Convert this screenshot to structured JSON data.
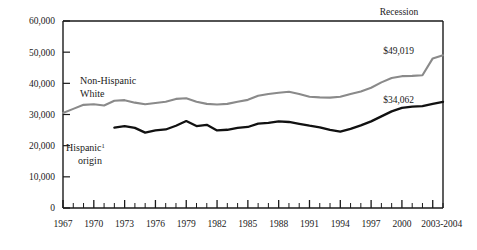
{
  "chart_data": {
    "type": "line",
    "title": "",
    "xlabel": "",
    "ylabel": "",
    "ylim": [
      0,
      60000
    ],
    "xlim": [
      1967,
      2004
    ],
    "grid": false,
    "legend_position": "inline-annotations",
    "ytick_labels": [
      "60,000",
      "50,000",
      "40,000",
      "30,000",
      "20,000",
      "10,000",
      "0"
    ],
    "ytick_values": [
      60000,
      50000,
      40000,
      30000,
      20000,
      10000,
      0
    ],
    "xtick_labels": [
      "1967",
      "1970",
      "1973",
      "1976",
      "1979",
      "1982",
      "1985",
      "1988",
      "1991",
      "1994",
      "1997",
      "2000",
      "2003-2004"
    ],
    "xtick_values": [
      1967,
      1970,
      1973,
      1976,
      1979,
      1982,
      1985,
      1988,
      1991,
      1994,
      1997,
      2000,
      2003
    ],
    "x": [
      1967,
      1968,
      1969,
      1970,
      1971,
      1972,
      1973,
      1974,
      1975,
      1976,
      1977,
      1978,
      1979,
      1980,
      1981,
      1982,
      1983,
      1984,
      1985,
      1986,
      1987,
      1988,
      1989,
      1990,
      1991,
      1992,
      1993,
      1994,
      1995,
      1996,
      1997,
      1998,
      1999,
      2000,
      2001,
      2002,
      2003,
      2004
    ],
    "series": [
      {
        "name": "Non-Hispanic White",
        "color": "#8a8a8a",
        "label_text": "Non-Hispanic",
        "label_text2": "White",
        "end_label": "$49,019",
        "end_value": 49019,
        "values": [
          30500,
          31800,
          33100,
          33300,
          32900,
          34400,
          34600,
          33800,
          33300,
          33700,
          34100,
          35000,
          35200,
          34100,
          33400,
          33200,
          33400,
          34100,
          34700,
          36000,
          36600,
          37000,
          37300,
          36600,
          35700,
          35500,
          35400,
          35700,
          36600,
          37400,
          38600,
          40300,
          41700,
          42300,
          42400,
          42600,
          48000,
          49019
        ]
      },
      {
        "name": "Hispanic origin",
        "color": "#111111",
        "label_text": "Hispanic",
        "label_sup": "1",
        "label_text2": "origin",
        "end_label": "$34,062",
        "end_value": 34062,
        "values": [
          null,
          null,
          null,
          null,
          null,
          25800,
          26300,
          25700,
          24200,
          24900,
          25200,
          26400,
          27900,
          26300,
          26700,
          24900,
          25100,
          25700,
          26000,
          27100,
          27300,
          27800,
          27600,
          27000,
          26400,
          25900,
          25100,
          24500,
          25400,
          26500,
          27800,
          29400,
          31000,
          32100,
          32500,
          32700,
          33400,
          34062
        ]
      }
    ],
    "annotations": [
      {
        "name": "recession-label",
        "text": "Recession",
        "x": 2001,
        "position": "above-plot-right"
      }
    ]
  }
}
